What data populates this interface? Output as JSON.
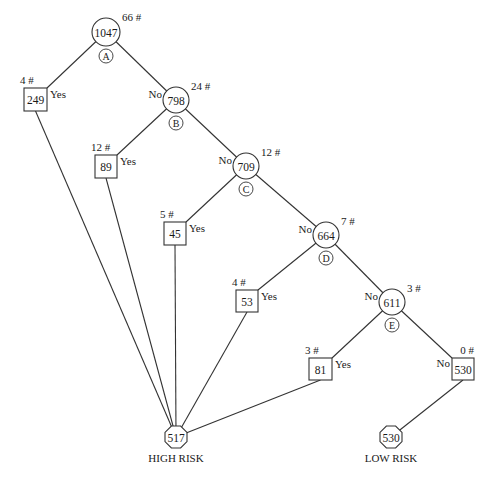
{
  "diagram": {
    "type": "decision-tree",
    "style": {
      "line_color": "#333333",
      "background": "#ffffff",
      "text_color": "#1a1a1a"
    },
    "decision_nodes": [
      {
        "id": "A",
        "letter": "A",
        "value": "1047",
        "count": "66 #",
        "branch_in": "",
        "cx": 106,
        "cy": 32,
        "r": 14
      },
      {
        "id": "B",
        "letter": "B",
        "value": "798",
        "count": "24 #",
        "branch_in": "No",
        "cx": 176,
        "cy": 100,
        "r": 13
      },
      {
        "id": "C",
        "letter": "C",
        "value": "709",
        "count": "12 #",
        "branch_in": "No",
        "cx": 246,
        "cy": 166,
        "r": 13
      },
      {
        "id": "D",
        "letter": "D",
        "value": "664",
        "count": "7 #",
        "branch_in": "No",
        "cx": 326,
        "cy": 235,
        "r": 13
      },
      {
        "id": "E",
        "letter": "E",
        "value": "611",
        "count": "3 #",
        "branch_in": "No",
        "cx": 392,
        "cy": 302,
        "r": 13
      }
    ],
    "box_nodes": [
      {
        "id": "y1",
        "value": "249",
        "count": "4 #",
        "branch": "Yes",
        "x": 24,
        "y": 88,
        "w": 23,
        "h": 23,
        "parent": "A",
        "target": "high"
      },
      {
        "id": "y2",
        "value": "89",
        "count": "12 #",
        "branch": "Yes",
        "x": 95,
        "y": 155,
        "w": 22,
        "h": 23,
        "parent": "B",
        "target": "high"
      },
      {
        "id": "y3",
        "value": "45",
        "count": "5 #",
        "branch": "Yes",
        "x": 164,
        "y": 222,
        "w": 22,
        "h": 23,
        "parent": "C",
        "target": "high"
      },
      {
        "id": "y4",
        "value": "53",
        "count": "4 #",
        "branch": "Yes",
        "x": 236,
        "y": 290,
        "w": 22,
        "h": 22,
        "parent": "D",
        "target": "high"
      },
      {
        "id": "y5",
        "value": "81",
        "count": "3 #",
        "branch": "Yes",
        "x": 309,
        "y": 358,
        "w": 23,
        "h": 22,
        "parent": "E",
        "target": "high"
      },
      {
        "id": "n5",
        "value": "530",
        "count": "0 #",
        "branch": "No",
        "x": 452,
        "y": 358,
        "w": 22,
        "h": 22,
        "parent": "E",
        "target": "low"
      }
    ],
    "terminals": {
      "high": {
        "value": "517",
        "label": "HIGH RISK",
        "cx": 176,
        "cy": 437,
        "size": 22
      },
      "low": {
        "value": "530",
        "label": "LOW RISK",
        "cx": 391,
        "cy": 437,
        "size": 22
      }
    }
  }
}
